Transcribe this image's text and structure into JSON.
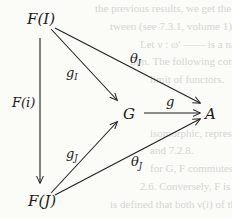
{
  "diagram": {
    "type": "commutative-diagram",
    "nodes": {
      "FI": {
        "label": "F(I)"
      },
      "FJ": {
        "label": "F(J)"
      },
      "G": {
        "label": "G"
      },
      "A": {
        "label": "A"
      }
    },
    "edges": [
      {
        "id": "Fi",
        "from": "FI",
        "to": "FJ",
        "label": "F(i)",
        "label_main": "F(i)",
        "label_sub": ""
      },
      {
        "id": "gI",
        "from": "FI",
        "to": "G",
        "label": "g_I",
        "label_main": "g",
        "label_sub": "I"
      },
      {
        "id": "thetaI",
        "from": "FI",
        "to": "A",
        "label": "θ_I",
        "label_main": "θ",
        "label_sub": "I"
      },
      {
        "id": "g",
        "from": "G",
        "to": "A",
        "label": "g",
        "label_main": "g",
        "label_sub": ""
      },
      {
        "id": "gJ",
        "from": "FJ",
        "to": "G",
        "label": "g_J",
        "label_main": "g",
        "label_sub": "J"
      },
      {
        "id": "thetaJ",
        "from": "FJ",
        "to": "A",
        "label": "θ_J",
        "label_main": "θ",
        "label_sub": "J"
      }
    ]
  },
  "background_bleed": [
    "the previous results, we get the rec",
    "tween (see 7.3.1, volume 1).",
    "Let ν : ω' —— is a natural transfor",
    "tion. The following conditions are equi",
    "limit of functors.",
    "isomorphic, representable, natural",
    "and 7.2.8.",
    "for G, F commutes with limits",
    "2.6. Conversely, F is natural",
    "is defined that both ν(i) of the"
  ]
}
